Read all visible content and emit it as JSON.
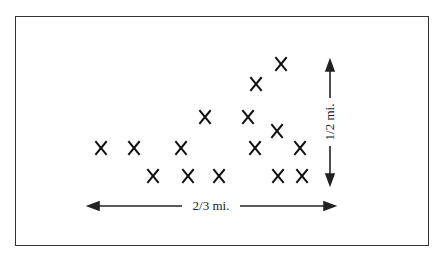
{
  "diagram": {
    "marker_glyph": "X",
    "marker_color": "#111111",
    "marks": [
      {
        "x": 101,
        "y": 148
      },
      {
        "x": 134,
        "y": 148
      },
      {
        "x": 181,
        "y": 148
      },
      {
        "x": 255,
        "y": 148
      },
      {
        "x": 300,
        "y": 148
      },
      {
        "x": 153,
        "y": 176
      },
      {
        "x": 188,
        "y": 176
      },
      {
        "x": 219,
        "y": 176
      },
      {
        "x": 278,
        "y": 176
      },
      {
        "x": 302,
        "y": 176
      },
      {
        "x": 205,
        "y": 117
      },
      {
        "x": 248,
        "y": 117
      },
      {
        "x": 277,
        "y": 131
      },
      {
        "x": 256,
        "y": 84
      },
      {
        "x": 281,
        "y": 64
      }
    ],
    "width_label": "2/3 mi.",
    "height_label": "1/2 mi."
  }
}
